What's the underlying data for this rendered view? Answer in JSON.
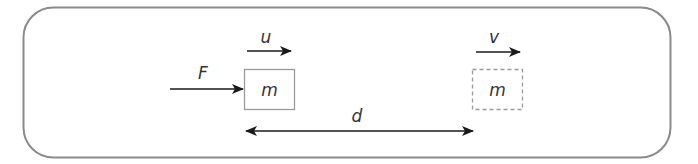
{
  "diagram": {
    "colors": {
      "frame": "#8a8a8a",
      "arrow": "#1a1a1a",
      "box": "#9a9a9a",
      "text": "#333333"
    },
    "labels": {
      "force": "F",
      "initial_velocity": "u",
      "final_velocity": "v",
      "distance": "d",
      "mass_initial": "m",
      "mass_final": "m"
    }
  }
}
